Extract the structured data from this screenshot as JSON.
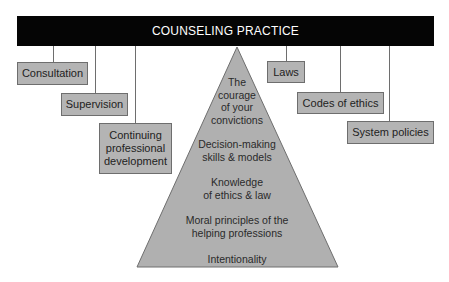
{
  "diagram": {
    "title": "COUNSELING PRACTICE",
    "left_boxes": [
      {
        "label": "Consultation"
      },
      {
        "label": "Supervision"
      },
      {
        "label": "Continuing\nprofessional\ndevelopment"
      }
    ],
    "right_boxes": [
      {
        "label": "Laws"
      },
      {
        "label": "Codes of ethics"
      },
      {
        "label": "System policies"
      }
    ],
    "pyramid_levels": [
      {
        "label": "The\ncourage\nof your\nconvictions"
      },
      {
        "label": "Decision-making\nskills & models"
      },
      {
        "label": "Knowledge\nof ethics & law"
      },
      {
        "label": "Moral principles of the\nhelping professions"
      },
      {
        "label": "Intentionality"
      }
    ],
    "colors": {
      "bar": "#050505",
      "box_fill": "#b4b4b4",
      "pyramid_fill": "#b0b0b0",
      "lines": "#6e6e6e"
    }
  }
}
